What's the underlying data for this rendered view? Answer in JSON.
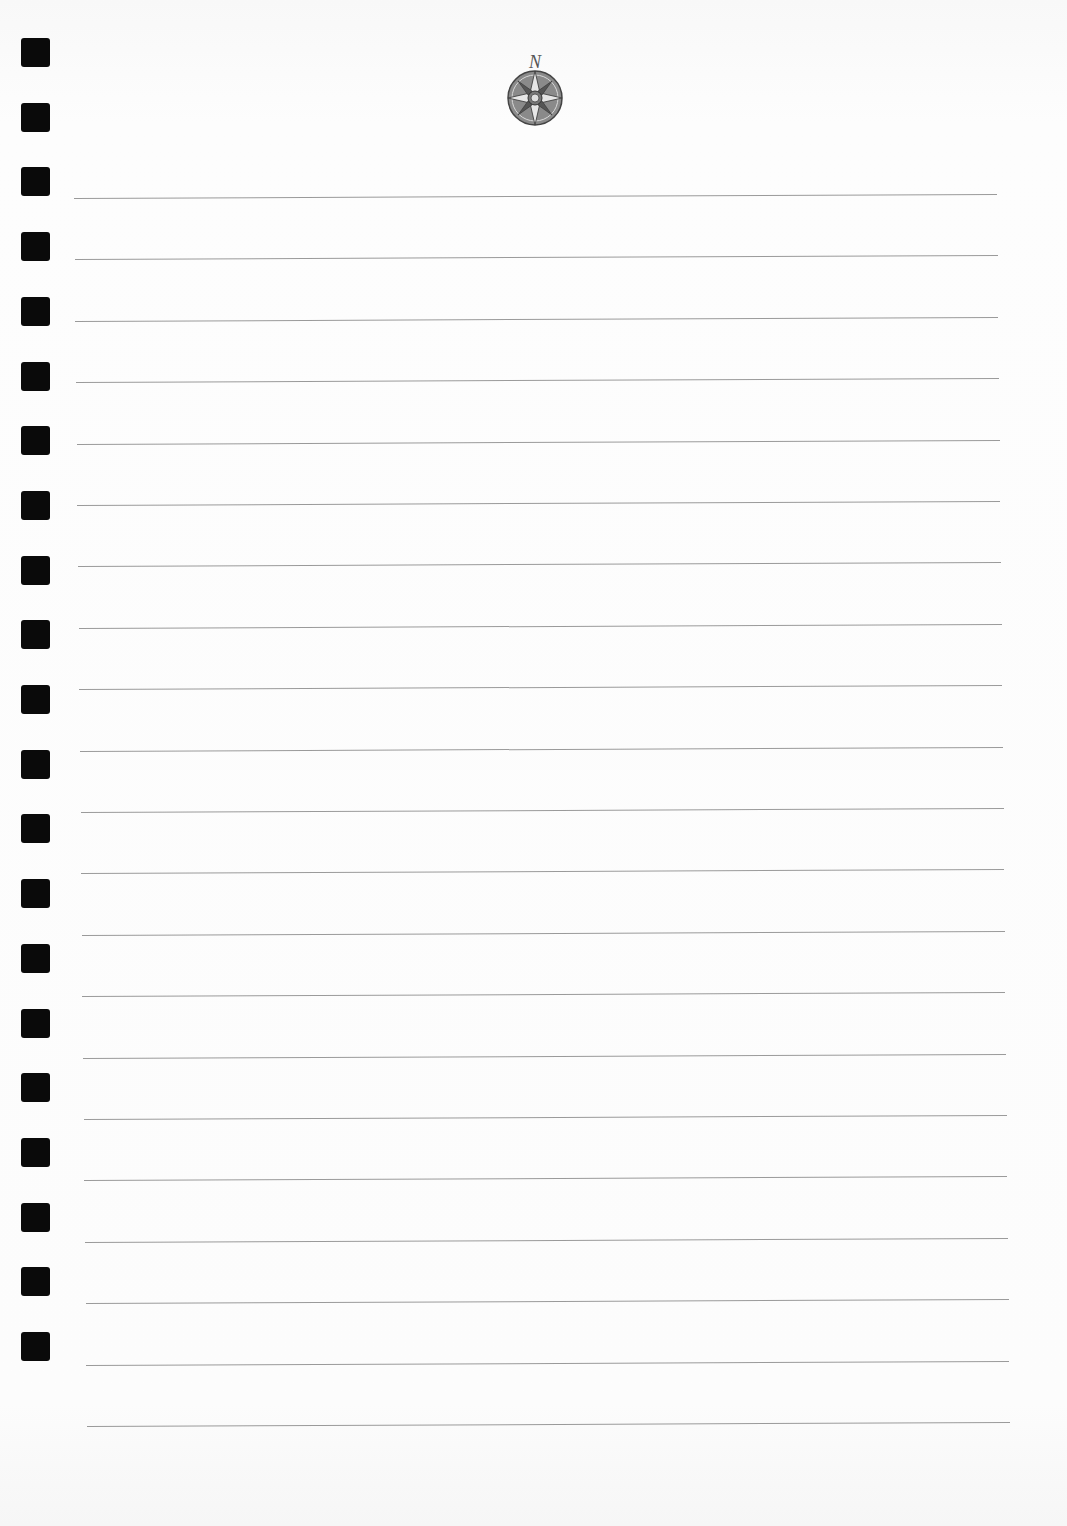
{
  "page": {
    "type": "ruled-notebook-page",
    "background": "#fcfcfc",
    "line_color": "#9a9a9a",
    "punch_color": "#0a0a0a"
  },
  "emblem": {
    "icon": "compass-rose-icon",
    "letter": "N",
    "color": "#555555"
  },
  "punch_holes": {
    "count": 21,
    "first_top": 38,
    "pitch": 64.7,
    "size": 29,
    "left": 21
  },
  "ruled_lines": {
    "count": 21,
    "first_y": 198,
    "pitch": 61.4,
    "x_start_first": 74,
    "x_end_first": 997,
    "x_start_last": 87,
    "x_end_last": 1010,
    "tilt_deg": -0.25
  }
}
